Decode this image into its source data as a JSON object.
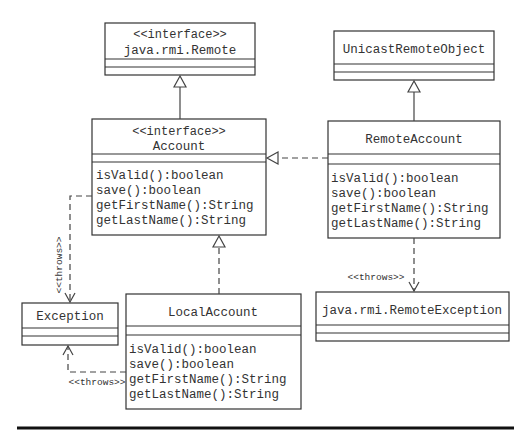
{
  "diagram": {
    "type": "uml-class-diagram",
    "classes": {
      "remote": {
        "stereotype": "<<interface>>",
        "name": "java.rmi.Remote",
        "methods": []
      },
      "unicast": {
        "stereotype": "",
        "name": "UnicastRemoteObject",
        "methods": []
      },
      "account": {
        "stereotype": "<<interface>>",
        "name": "Account",
        "methods": [
          "isValid():boolean",
          "save():boolean",
          "getFirstName():String",
          "getLastName():String"
        ]
      },
      "remote_account": {
        "stereotype": "",
        "name": "RemoteAccount",
        "methods": [
          "isValid():boolean",
          "save():boolean",
          "getFirstName():String",
          "getLastName():String"
        ]
      },
      "exception": {
        "stereotype": "",
        "name": "Exception",
        "methods": []
      },
      "local_account": {
        "stereotype": "",
        "name": "LocalAccount",
        "methods": [
          "isValid():boolean",
          "save():boolean",
          "getFirstName():String",
          "getLastName():String"
        ]
      },
      "remote_exception": {
        "stereotype": "",
        "name": "java.rmi.RemoteException",
        "methods": []
      }
    },
    "relationships": [
      {
        "from": "Account",
        "to": "java.rmi.Remote",
        "kind": "generalization",
        "label": ""
      },
      {
        "from": "RemoteAccount",
        "to": "UnicastRemoteObject",
        "kind": "generalization",
        "label": ""
      },
      {
        "from": "RemoteAccount",
        "to": "Account",
        "kind": "realization",
        "label": ""
      },
      {
        "from": "LocalAccount",
        "to": "Account",
        "kind": "realization",
        "label": ""
      },
      {
        "from": "Account",
        "to": "Exception",
        "kind": "dependency",
        "label": "<<throws>>"
      },
      {
        "from": "LocalAccount",
        "to": "Exception",
        "kind": "dependency",
        "label": "<<throws>>"
      },
      {
        "from": "RemoteAccount",
        "to": "java.rmi.RemoteException",
        "kind": "dependency",
        "label": "<<throws>>"
      }
    ],
    "labels": {
      "throws_account": "<<throws>>",
      "throws_local": "<<throws>>",
      "throws_remote": "<<throws>>"
    }
  }
}
